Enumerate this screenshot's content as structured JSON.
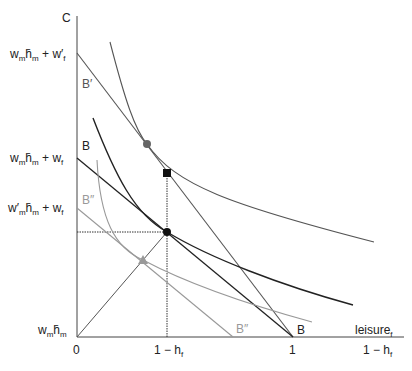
{
  "diagram": {
    "y_axis_label": "C",
    "x_axis_label": "leisure",
    "x_axis_label_sub": "f",
    "origin_label": "0",
    "x_ticks": [
      {
        "main": "1 −  h",
        "sub": "f"
      },
      {
        "main": "1",
        "sub": ""
      },
      {
        "main": "1 −  h",
        "sub": "f"
      }
    ],
    "y_labels": [
      {
        "id": "top",
        "text": "w_m h̄_m + w′_f"
      },
      {
        "id": "mid",
        "text": "w_m h̄_m + w_f"
      },
      {
        "id": "low",
        "text": "w′_m h̄_m + w_f"
      },
      {
        "id": "base",
        "text": "w_m h̄_m"
      }
    ],
    "line_labels": {
      "b_prime": "B′",
      "b_upper": "B",
      "b_double_prime_upper": "B″",
      "b_double_prime_lower": "B″",
      "b_lower": "B"
    },
    "markers": [
      {
        "shape": "circle",
        "color": "#666666",
        "desc": "tangency on B′"
      },
      {
        "shape": "square",
        "color": "#111111",
        "desc": "point above at 1 − h_f"
      },
      {
        "shape": "circle",
        "color": "#111111",
        "desc": "tangency on B"
      },
      {
        "shape": "triangle",
        "color": "#999999",
        "desc": "tangency on B″"
      }
    ],
    "colors": {
      "axis": "#444444",
      "dark_line": "#222222",
      "mid_line": "#555555",
      "light_line": "#999999"
    }
  }
}
